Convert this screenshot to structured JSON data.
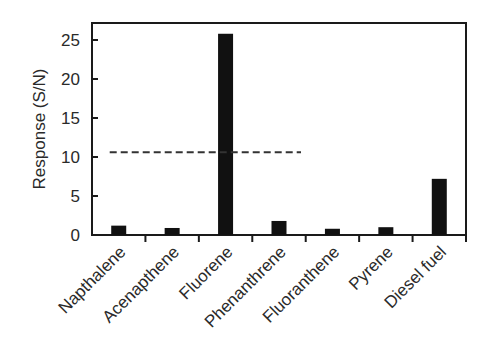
{
  "chart_data": {
    "type": "bar",
    "title": "",
    "xlabel": "",
    "ylabel": "Response (S/N)",
    "ylim": [
      0,
      27.5
    ],
    "yticks": [
      0,
      5,
      10,
      15,
      20,
      25
    ],
    "categories": [
      "Napthalene",
      "Acenapthene",
      "Fluorene",
      "Phenanthrene",
      "Fluoranthene",
      "Pyrene",
      "Diesel fuel"
    ],
    "values": [
      1.2,
      0.9,
      25.8,
      1.8,
      0.8,
      1.0,
      7.2
    ],
    "bar_color": "#111111",
    "grid": false,
    "legend": null,
    "annotations": [
      {
        "type": "dashed-hline",
        "y": 10.6,
        "x_start_category": "Napthalene",
        "x_end_category": "Phenanthrene",
        "color": "#333333"
      }
    ]
  }
}
